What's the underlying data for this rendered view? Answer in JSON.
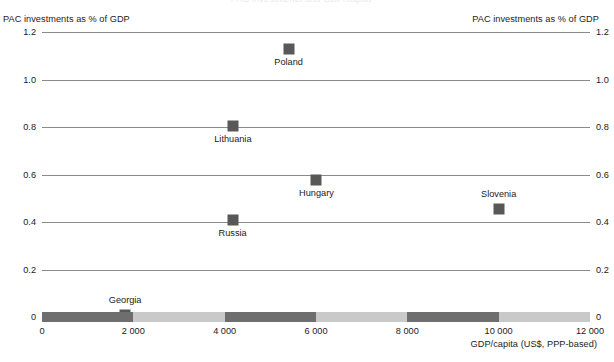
{
  "chart_data": {
    "type": "scatter",
    "title": "",
    "xlabel": "GDP/capita (US$, PPP-based)",
    "ylabel": "PAC investments as % of GDP",
    "ylabel_right": "PAC investments as % of GDP",
    "xlim": [
      0,
      12000
    ],
    "ylim": [
      0,
      1.2
    ],
    "grid": true,
    "legend": "none",
    "x_ticks": [
      "0",
      "2 000",
      "4 000",
      "6 000",
      "8 000",
      "10 000",
      "12 000"
    ],
    "x_tick_values": [
      0,
      2000,
      4000,
      6000,
      8000,
      10000,
      12000
    ],
    "y_ticks": [
      "0",
      "0.2",
      "0.4",
      "0.6",
      "0.8",
      "1.0",
      "1.2"
    ],
    "y_tick_values": [
      0,
      0.2,
      0.4,
      0.6,
      0.8,
      1.0,
      1.2
    ],
    "points": [
      {
        "label": "Poland",
        "x": 5400,
        "y": 1.13,
        "label_pos": "below"
      },
      {
        "label": "Lithuania",
        "x": 4180,
        "y": 0.805,
        "label_pos": "below"
      },
      {
        "label": "Hungary",
        "x": 6010,
        "y": 0.575,
        "label_pos": "below"
      },
      {
        "label": "Slovenia",
        "x": 10000,
        "y": 0.455,
        "label_pos": "above"
      },
      {
        "label": "Russia",
        "x": 4175,
        "y": 0.41,
        "label_pos": "below"
      },
      {
        "label": "Georgia",
        "x": 1820,
        "y": 0.01,
        "label_pos": "above"
      }
    ]
  },
  "colors": {
    "marker": "#585858",
    "gridline": "#8a8a8a",
    "axis_bar_dark": "#6e6e6e",
    "axis_bar_light": "#c9c9c9",
    "text": "#1a1a1a"
  },
  "clipped_title": "PAC investments and GDP/capita"
}
